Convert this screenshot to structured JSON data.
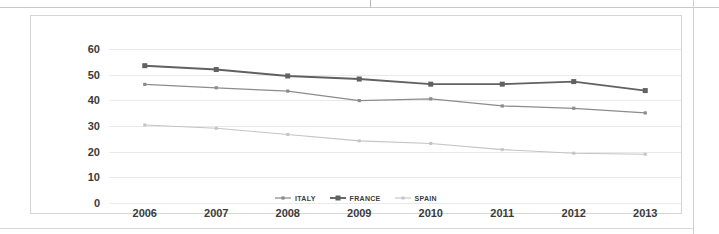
{
  "chart_data": {
    "type": "line",
    "title": "",
    "subtitle": "",
    "xlabel": "",
    "ylabel": "",
    "categories": [
      "2006",
      "2007",
      "2008",
      "2009",
      "2010",
      "2011",
      "2012",
      "2013"
    ],
    "ylim": [
      0,
      60
    ],
    "yticks": [
      "0",
      "10",
      "20",
      "30",
      "40",
      "50",
      "60"
    ],
    "ytick_values": [
      0,
      10,
      20,
      30,
      40,
      50,
      60
    ],
    "grid": true,
    "legend_position": "bottom",
    "series": [
      {
        "name": "ITALY",
        "color": "#8c8c8c",
        "marker": "square",
        "values": [
          46.2,
          44.9,
          43.6,
          39.9,
          40.6,
          37.8,
          36.9,
          35.1
        ]
      },
      {
        "name": "FRANCE",
        "color": "#616161",
        "marker": "square",
        "values": [
          53.5,
          52.0,
          49.5,
          48.3,
          46.3,
          46.3,
          47.3,
          43.8
        ]
      },
      {
        "name": "SPAIN",
        "color": "#c4c4c4",
        "marker": "square",
        "values": [
          30.4,
          29.1,
          26.7,
          24.2,
          23.2,
          20.8,
          19.4,
          19.0
        ]
      }
    ]
  },
  "colors": {
    "gridline": "#e9e9e9",
    "axis_text": "#3b3b3b",
    "panel_border": "#d6d6d6",
    "background": "#ffffff"
  }
}
